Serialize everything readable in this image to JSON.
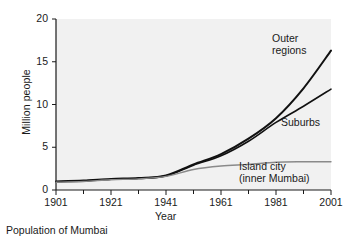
{
  "caption": "Population of Mumbai",
  "colors": {
    "plot_background": "#f1f1f1",
    "page_background": "#ffffff",
    "axis": "#1a1a1a",
    "outer_regions": "#111111",
    "suburbs": "#111111",
    "island_city": "#8a8a8a",
    "text": "#1a1a1a"
  },
  "labels": {
    "outer_regions": "Outer\nregions",
    "suburbs": "Suburbs",
    "island_city": "Island city\n(inner Mumbai)"
  },
  "chart_data": {
    "type": "line",
    "title": "Population of Mumbai",
    "xlabel": "Year",
    "ylabel": "Million people",
    "xlim": [
      1901,
      2001
    ],
    "ylim": [
      0,
      20
    ],
    "xticks": [
      1901,
      1921,
      1941,
      1961,
      1981,
      2001
    ],
    "xtick_labels": [
      "1901",
      "1921",
      "1941",
      "1961",
      "1981",
      "2001"
    ],
    "xticks_minor": [
      1911,
      1931,
      1951,
      1971,
      1991
    ],
    "yticks": [
      0,
      5,
      10,
      15,
      20
    ],
    "ytick_labels": [
      "0",
      "5",
      "10",
      "15",
      "20"
    ],
    "grid": false,
    "legend": "in-plot annotations",
    "x": [
      1901,
      1911,
      1921,
      1931,
      1941,
      1951,
      1961,
      1971,
      1981,
      1991,
      2001
    ],
    "series": [
      {
        "name": "Outer regions",
        "label": "Outer\nregions",
        "color": "#111111",
        "width": 2.0,
        "values": [
          1.0,
          1.1,
          1.3,
          1.4,
          1.7,
          3.0,
          4.2,
          6.0,
          8.4,
          11.9,
          16.3
        ]
      },
      {
        "name": "Suburbs",
        "label": "Suburbs",
        "color": "#111111",
        "width": 1.6,
        "values": [
          0.95,
          1.05,
          1.25,
          1.35,
          1.65,
          2.9,
          4.0,
          5.7,
          7.9,
          9.8,
          11.8
        ]
      },
      {
        "name": "Island city (inner Mumbai)",
        "label": "Island city\n(inner Mumbai)",
        "color": "#8a8a8a",
        "width": 1.4,
        "values": [
          0.9,
          1.0,
          1.2,
          1.3,
          1.6,
          2.4,
          2.8,
          3.0,
          3.25,
          3.3,
          3.3
        ]
      }
    ]
  }
}
